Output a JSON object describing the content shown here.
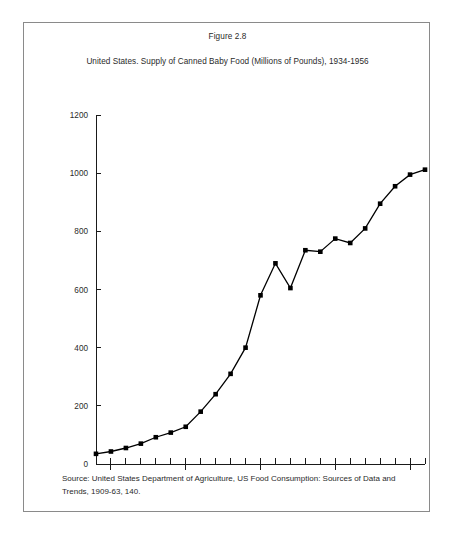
{
  "figure": {
    "caption": "Figure 2.8",
    "subtitle": "United States. Supply of Canned Baby Food (Millions of Pounds), 1934-1956",
    "source_note": "Source: United States Department of Agriculture, US Food Consumption: Sources of Data and Trends, 1909-63, 140."
  },
  "chart_data": {
    "type": "line",
    "title": "United States. Supply of Canned Baby Food (Millions of Pounds), 1934-1956",
    "xlabel": "",
    "ylabel": "",
    "xlim": [
      1934,
      1956
    ],
    "ylim": [
      0,
      1200
    ],
    "grid": false,
    "legend": "none",
    "x_tick_labels": [
      "1935",
      "1940",
      "1945",
      "1950",
      "1955"
    ],
    "x_tick_values": [
      1935,
      1940,
      1945,
      1950,
      1955
    ],
    "x_minor_tick_values": [
      1934,
      1935,
      1936,
      1937,
      1938,
      1939,
      1940,
      1941,
      1942,
      1943,
      1944,
      1945,
      1946,
      1947,
      1948,
      1949,
      1950,
      1951,
      1952,
      1953,
      1954,
      1955,
      1956
    ],
    "y_tick_labels": [
      "0",
      "200",
      "400",
      "600",
      "800",
      "1000",
      "1200"
    ],
    "y_tick_values": [
      0,
      200,
      400,
      600,
      800,
      1000,
      1200
    ],
    "marker": "square",
    "color": "#000000",
    "x": [
      1934,
      1935,
      1936,
      1937,
      1938,
      1939,
      1940,
      1941,
      1942,
      1943,
      1944,
      1945,
      1946,
      1947,
      1948,
      1949,
      1950,
      1951,
      1952,
      1953,
      1954,
      1955,
      1956
    ],
    "values": [
      35,
      43,
      55,
      70,
      92,
      108,
      128,
      180,
      240,
      310,
      400,
      580,
      690,
      605,
      735,
      730,
      775,
      760,
      810,
      895,
      955,
      995,
      1012
    ],
    "series": [
      {
        "name": "Supply of Canned Baby Food (Millions of Pounds)",
        "values": [
          35,
          43,
          55,
          70,
          92,
          108,
          128,
          180,
          240,
          310,
          400,
          580,
          690,
          605,
          735,
          730,
          775,
          760,
          810,
          895,
          955,
          995,
          1012
        ]
      }
    ]
  }
}
